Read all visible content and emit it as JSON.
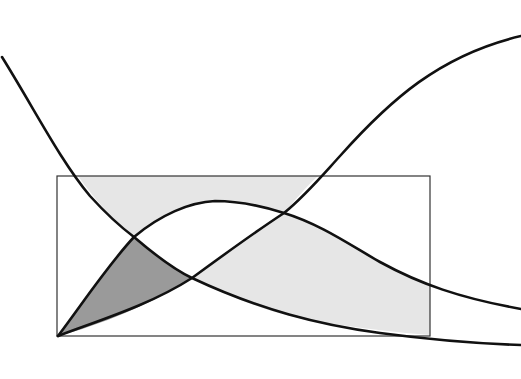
{
  "diagram": {
    "type": "curve-intersection-regions",
    "colors": {
      "background": "#ffffff",
      "curve_stroke": "#111111",
      "frame_stroke": "#333333",
      "light_fill": "#e6e6e6",
      "dark_fill": "#9a9a9a"
    },
    "frame": {
      "x": 57,
      "y": 176,
      "width": 373,
      "height": 160
    },
    "curves": [
      {
        "name": "decreasing-curve",
        "shape": "falls from upper-left, crosses frame, flattens at right"
      },
      {
        "name": "hump-curve",
        "shape": "rises from frame bottom-left, peaks near x=215, falls to bottom-right"
      },
      {
        "name": "increasing-curve",
        "shape": "rises from frame bottom-left to top-right (sigmoid)"
      }
    ],
    "regions": [
      {
        "name": "dark-region",
        "fill": "dark",
        "bounded_by": [
          "hump-curve",
          "decreasing-curve",
          "increasing-curve"
        ]
      },
      {
        "name": "light-region-top",
        "fill": "light",
        "bounded_by": [
          "decreasing-curve",
          "hump-curve",
          "increasing-curve",
          "frame-top"
        ]
      },
      {
        "name": "light-region-bottom-right",
        "fill": "light",
        "bounded_by": [
          "decreasing-curve",
          "increasing-curve",
          "hump-curve",
          "frame-right"
        ]
      }
    ]
  }
}
